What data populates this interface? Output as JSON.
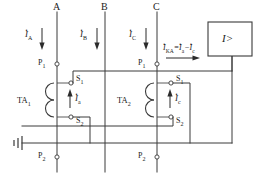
{
  "diagram": {
    "colors": {
      "wire": "#3a3a3a",
      "text": "#1c1c1c",
      "background": "#ffffff"
    },
    "phase_labels": [
      {
        "name": "phase-a",
        "text": "A"
      },
      {
        "name": "phase-b",
        "text": "B"
      },
      {
        "name": "phase-c",
        "text": "C"
      }
    ],
    "phase_currents": [
      {
        "name": "current-ia",
        "symbol": "I",
        "sub": "A"
      },
      {
        "name": "current-ib",
        "symbol": "I",
        "sub": "B"
      },
      {
        "name": "current-ic",
        "symbol": "I",
        "sub": "C"
      }
    ],
    "transformers": [
      {
        "name": "ta1",
        "label": "TA",
        "index": "1",
        "primary_top": "P",
        "primary_top_sub": "1",
        "primary_bottom": "P",
        "primary_bottom_sub": "2",
        "secondary_top": "S",
        "secondary_top_sub": "1",
        "secondary_bottom": "S",
        "secondary_bottom_sub": "2",
        "secondary_current_symbol": "I",
        "secondary_current_sub": "a"
      },
      {
        "name": "ta2",
        "label": "TA",
        "index": "2",
        "primary_top": "P",
        "primary_top_sub": "1",
        "primary_bottom": "P",
        "primary_bottom_sub": "2",
        "secondary_top": "S",
        "secondary_top_sub": "1",
        "secondary_bottom": "S",
        "secondary_bottom_sub": "2",
        "secondary_current_symbol": "I",
        "secondary_current_sub": "c"
      }
    ],
    "relay": {
      "name": "overcurrent-relay",
      "symbol": "I",
      "operator": ">"
    },
    "relay_current": {
      "name": "relay-current-equation",
      "symbol": "I",
      "sub": "KA",
      "equals": "=",
      "term1_symbol": "I",
      "term1_sub": "a",
      "minus": "−",
      "term2_symbol": "I",
      "term2_sub": "c"
    },
    "ground": {
      "name": "earth-ground",
      "label": ""
    }
  }
}
